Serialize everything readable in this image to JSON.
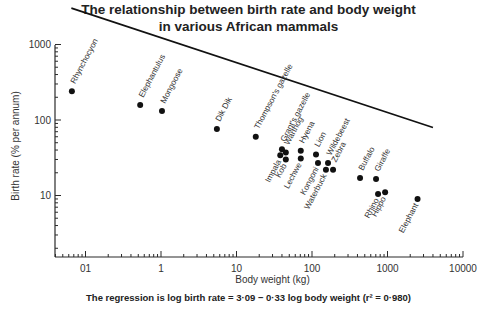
{
  "title_line1": "The relationship between birth rate and body weight",
  "title_line2": "in various  African mammals",
  "footnote": "The regression is log birth rate = 3·09 − 0·33 log body weight (r² = 0·980)",
  "chart_data": {
    "type": "scatter",
    "xlabel": "Body weight (kg)",
    "ylabel": "Birth rate (% per annum)",
    "xscale": "log",
    "yscale": "log",
    "xlim": [
      0.04,
      10000
    ],
    "ylim": [
      1.5,
      1000
    ],
    "x_ticks": [
      0.1,
      1,
      10,
      100,
      1000,
      10000
    ],
    "x_tick_labels": [
      "01",
      "1",
      "10",
      "100",
      "1000",
      "10000"
    ],
    "y_ticks": [
      10,
      100,
      1000
    ],
    "y_tick_labels": [
      "10",
      "100",
      "1000"
    ],
    "grid": false,
    "legend": null,
    "regression": {
      "equation": "log birth rate = 3.09 - 0.33 log body weight",
      "intercept": 3.09,
      "slope": -0.33,
      "r_squared": 0.98,
      "x_range": [
        0.065,
        4000
      ]
    },
    "points": [
      {
        "name": "Rhynchocyon",
        "x": 0.066,
        "y": 240,
        "label_pos": "above"
      },
      {
        "name": "Elephantulus",
        "x": 0.53,
        "y": 158,
        "label_pos": "above"
      },
      {
        "name": "Mongoose",
        "x": 1.03,
        "y": 132,
        "label_pos": "above"
      },
      {
        "name": "Dik Dik",
        "x": 5.5,
        "y": 76,
        "label_pos": "above"
      },
      {
        "name": "Thompson's  gazelle",
        "x": 18,
        "y": 60,
        "label_pos": "above"
      },
      {
        "name": "Grant's  gazelle",
        "x": 40,
        "y": 41,
        "label_pos": "above"
      },
      {
        "name": "Warthog",
        "x": 45,
        "y": 37,
        "label_pos": "above"
      },
      {
        "name": "Impala",
        "x": 38,
        "y": 34,
        "label_pos": "below"
      },
      {
        "name": "Kob",
        "x": 45,
        "y": 30,
        "label_pos": "below"
      },
      {
        "name": "Hyena",
        "x": 71,
        "y": 39,
        "label_pos": "above"
      },
      {
        "name": "Lechwe",
        "x": 71,
        "y": 31,
        "label_pos": "below"
      },
      {
        "name": "Lion",
        "x": 113,
        "y": 35,
        "label_pos": "above"
      },
      {
        "name": "Kongoni",
        "x": 120,
        "y": 27,
        "label_pos": "below"
      },
      {
        "name": "Wildebeest",
        "x": 163,
        "y": 27,
        "label_pos": "above"
      },
      {
        "name": "Waterbuck",
        "x": 153,
        "y": 22,
        "label_pos": "below"
      },
      {
        "name": "Zebra",
        "x": 190,
        "y": 22,
        "label_pos": "above"
      },
      {
        "name": "Buffalo",
        "x": 433,
        "y": 17,
        "label_pos": "above"
      },
      {
        "name": "Giraffe",
        "x": 705,
        "y": 16.5,
        "label_pos": "above"
      },
      {
        "name": "Rhino",
        "x": 750,
        "y": 10.5,
        "label_pos": "below"
      },
      {
        "name": "Hippo",
        "x": 930,
        "y": 11,
        "label_pos": "below"
      },
      {
        "name": "Elephant",
        "x": 2500,
        "y": 9,
        "label_pos": "below"
      }
    ]
  }
}
